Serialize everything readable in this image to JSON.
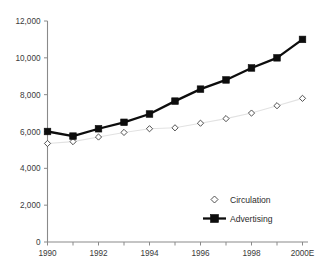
{
  "chart_data": {
    "type": "line",
    "title": "",
    "subtitle": "",
    "xlabel": "",
    "ylabel": "",
    "x": [
      1990,
      1991,
      1992,
      1993,
      1994,
      1995,
      1996,
      1997,
      1998,
      1999,
      2000
    ],
    "categories": [
      "1990",
      "1991",
      "1992",
      "1993",
      "1994",
      "1995",
      "1996",
      "1997",
      "1998",
      "1999",
      "2000E"
    ],
    "xtick_labels": [
      "1990",
      "1992",
      "1994",
      "1996",
      "1998",
      "2000E"
    ],
    "xtick_values": [
      1990,
      1992,
      1994,
      1996,
      1998,
      2000
    ],
    "ytick_labels": [
      "0",
      "2,000",
      "4,000",
      "6,000",
      "8,000",
      "10,000",
      "12,000"
    ],
    "ytick_values": [
      0,
      2000,
      4000,
      6000,
      8000,
      10000,
      12000
    ],
    "ylim": [
      0,
      12000
    ],
    "xlim": [
      1990,
      2000
    ],
    "grid": false,
    "legend_position": "inside-lower-right",
    "series": [
      {
        "name": "Circulation",
        "marker": "open-diamond",
        "color": "#e2e2e2",
        "marker_color": "#ffffff",
        "marker_edge_color": "#3d3d3d",
        "values": [
          5350,
          5450,
          5700,
          5950,
          6150,
          6200,
          6450,
          6700,
          7000,
          7400,
          7800
        ]
      },
      {
        "name": "Advertising",
        "marker": "filled-square",
        "color": "#0d0d0d",
        "marker_color": "#0d0d0d",
        "marker_edge_color": "#0d0d0d",
        "values": [
          6000,
          5750,
          6150,
          6500,
          6950,
          7650,
          8300,
          8800,
          9450,
          10000,
          11000
        ]
      }
    ]
  },
  "legend": {
    "items": [
      {
        "label": "Circulation"
      },
      {
        "label": "Advertising"
      }
    ]
  }
}
